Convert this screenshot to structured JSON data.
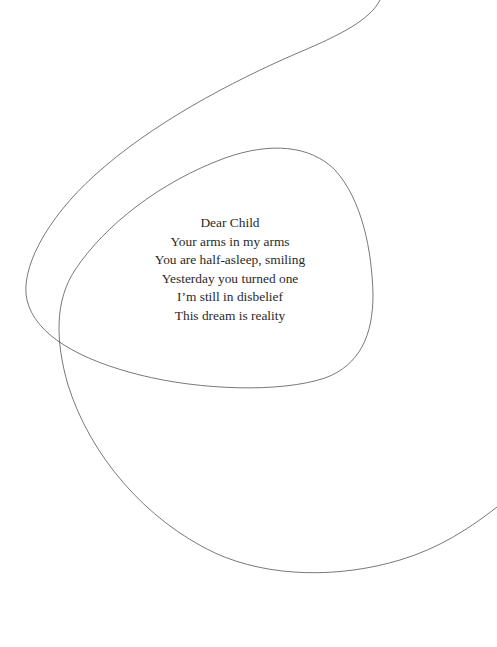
{
  "poem": {
    "lines": [
      "Dear Child",
      "Your arms in my arms",
      "You are half-asleep, smiling",
      "Yesterday you turned one",
      "I’m still in disbelief",
      "This dream is reality"
    ]
  },
  "decoration": {
    "line_color": "#555555",
    "background": "#ffffff"
  }
}
